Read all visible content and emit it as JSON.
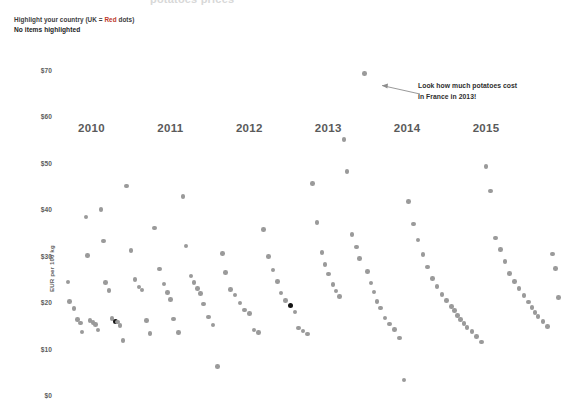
{
  "page": {
    "cut_off_title": "potatoes prices"
  },
  "controls": {
    "highlight_prompt_pre": "Highlight your country (UK = ",
    "highlight_prompt_accent": "Red",
    "highlight_prompt_post": " dots)",
    "highlight_status": "No items highlighted",
    "accent_color": "#c0392b"
  },
  "annotation": {
    "line1": "Look how much potatoes cost",
    "line2": "in France in 2013!",
    "target_x": 2013.45,
    "target_y": 69.2
  },
  "chart_data": {
    "type": "scatter",
    "title": "",
    "xlabel": "",
    "ylabel": "EUR per 100 kg",
    "xlim": [
      2009.55,
      2015.95
    ],
    "ylim": [
      0,
      70
    ],
    "grid": false,
    "legend": "none",
    "xticks": [
      2010,
      2011,
      2012,
      2013,
      2014,
      2015
    ],
    "xtick_labels": [
      "2010",
      "2011",
      "2012",
      "2013",
      "2014",
      "2015"
    ],
    "yticks": [
      0,
      10,
      20,
      30,
      40,
      50,
      60,
      70
    ],
    "ytick_labels": [
      "$0",
      "$10",
      "$20",
      "$30",
      "$40",
      "$50",
      "$60",
      "$70"
    ],
    "dot_color": "#9a9a9a",
    "highlight_color": "#141414",
    "series": [
      {
        "name": "prices",
        "points": [
          [
            2009.7,
            24.3
          ],
          [
            2009.72,
            20.2
          ],
          [
            2009.78,
            18.6
          ],
          [
            2009.82,
            16.2
          ],
          [
            2009.86,
            15.5
          ],
          [
            2009.88,
            13.6
          ],
          [
            2009.93,
            38.3
          ],
          [
            2009.95,
            30.0
          ],
          [
            2009.98,
            16.0
          ],
          [
            2010.02,
            15.6
          ],
          [
            2010.05,
            15.2
          ],
          [
            2010.08,
            14.0
          ],
          [
            2010.12,
            39.9
          ],
          [
            2010.15,
            33.2
          ],
          [
            2010.18,
            24.2
          ],
          [
            2010.22,
            22.5
          ],
          [
            2010.26,
            16.5
          ],
          [
            2010.3,
            15.9
          ],
          [
            2010.33,
            15.7
          ],
          [
            2010.36,
            15.0
          ],
          [
            2010.4,
            11.8
          ],
          [
            2010.44,
            45.0
          ],
          [
            2010.5,
            31.1
          ],
          [
            2010.55,
            24.9
          ],
          [
            2010.6,
            23.3
          ],
          [
            2010.64,
            22.6
          ],
          [
            2010.7,
            16.0
          ],
          [
            2010.74,
            13.2
          ],
          [
            2010.8,
            36.0
          ],
          [
            2010.86,
            27.1
          ],
          [
            2010.92,
            23.9
          ],
          [
            2010.96,
            22.1
          ],
          [
            2011.0,
            20.6
          ],
          [
            2011.04,
            16.4
          ],
          [
            2011.1,
            13.4
          ],
          [
            2011.16,
            42.8
          ],
          [
            2011.2,
            32.1
          ],
          [
            2011.26,
            25.6
          ],
          [
            2011.3,
            24.2
          ],
          [
            2011.34,
            23.0
          ],
          [
            2011.38,
            21.8
          ],
          [
            2011.42,
            19.6
          ],
          [
            2011.48,
            16.8
          ],
          [
            2011.54,
            15.1
          ],
          [
            2011.6,
            6.1
          ],
          [
            2011.66,
            30.5
          ],
          [
            2011.7,
            26.4
          ],
          [
            2011.76,
            22.7
          ],
          [
            2011.82,
            21.5
          ],
          [
            2011.88,
            19.8
          ],
          [
            2011.94,
            18.3
          ],
          [
            2012.0,
            17.6
          ],
          [
            2012.06,
            14.0
          ],
          [
            2012.12,
            13.5
          ],
          [
            2012.18,
            35.6
          ],
          [
            2012.24,
            29.8
          ],
          [
            2012.3,
            26.9
          ],
          [
            2012.36,
            24.5
          ],
          [
            2012.4,
            22.0
          ],
          [
            2012.46,
            20.4
          ],
          [
            2012.52,
            19.2
          ],
          [
            2012.58,
            17.9
          ],
          [
            2012.62,
            14.4
          ],
          [
            2012.68,
            13.8
          ],
          [
            2012.74,
            13.1
          ],
          [
            2012.8,
            45.5
          ],
          [
            2012.86,
            37.2
          ],
          [
            2012.92,
            30.7
          ],
          [
            2012.96,
            28.1
          ],
          [
            2013.0,
            26.1
          ],
          [
            2013.06,
            23.8
          ],
          [
            2013.1,
            22.4
          ],
          [
            2013.14,
            21.2
          ],
          [
            2013.2,
            55.0
          ],
          [
            2013.24,
            48.1
          ],
          [
            2013.3,
            34.6
          ],
          [
            2013.36,
            31.9
          ],
          [
            2013.4,
            29.4
          ],
          [
            2013.46,
            69.2
          ],
          [
            2013.5,
            26.6
          ],
          [
            2013.54,
            24.1
          ],
          [
            2013.58,
            22.2
          ],
          [
            2013.62,
            20.1
          ],
          [
            2013.66,
            18.7
          ],
          [
            2013.72,
            16.6
          ],
          [
            2013.78,
            15.3
          ],
          [
            2013.84,
            14.1
          ],
          [
            2013.9,
            12.3
          ],
          [
            2013.96,
            3.2
          ],
          [
            2014.02,
            41.7
          ],
          [
            2014.08,
            36.8
          ],
          [
            2014.14,
            33.4
          ],
          [
            2014.2,
            30.2
          ],
          [
            2014.26,
            27.6
          ],
          [
            2014.32,
            25.1
          ],
          [
            2014.38,
            23.4
          ],
          [
            2014.44,
            21.7
          ],
          [
            2014.5,
            20.3
          ],
          [
            2014.56,
            19.1
          ],
          [
            2014.6,
            18.2
          ],
          [
            2014.64,
            17.1
          ],
          [
            2014.68,
            16.3
          ],
          [
            2014.72,
            15.4
          ],
          [
            2014.76,
            14.6
          ],
          [
            2014.82,
            13.7
          ],
          [
            2014.88,
            12.6
          ],
          [
            2014.94,
            11.4
          ],
          [
            2015.0,
            49.2
          ],
          [
            2015.06,
            43.9
          ],
          [
            2015.12,
            33.8
          ],
          [
            2015.18,
            31.3
          ],
          [
            2015.24,
            28.7
          ],
          [
            2015.3,
            26.2
          ],
          [
            2015.36,
            24.4
          ],
          [
            2015.42,
            22.9
          ],
          [
            2015.48,
            21.4
          ],
          [
            2015.54,
            20.0
          ],
          [
            2015.58,
            18.9
          ],
          [
            2015.62,
            17.8
          ],
          [
            2015.66,
            16.9
          ],
          [
            2015.72,
            15.8
          ],
          [
            2015.78,
            14.8
          ],
          [
            2015.84,
            30.4
          ],
          [
            2015.88,
            27.3
          ],
          [
            2015.92,
            21.0
          ]
        ]
      }
    ],
    "highlighted_points": [
      [
        2010.3,
        15.9
      ],
      [
        2012.52,
        19.2
      ],
      [
        2013.1,
        27.0
      ],
      [
        2013.84,
        18.3
      ],
      [
        2015.0,
        21.0
      ]
    ],
    "highlighted_count": 0
  }
}
